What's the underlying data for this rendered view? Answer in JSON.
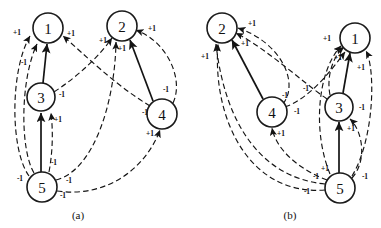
{
  "figure": {
    "width": 381,
    "height": 228,
    "background": "#ffffff",
    "ink_color": "#141414",
    "panels": [
      {
        "id": "panel-a",
        "caption": "(a)",
        "caption_pos": {
          "x": 78,
          "y": 215
        },
        "nodes": [
          {
            "id": "1",
            "label": "1",
            "x": 48,
            "y": 28,
            "r": 15
          },
          {
            "id": "2",
            "label": "2",
            "x": 122,
            "y": 26,
            "r": 15
          },
          {
            "id": "3",
            "label": "3",
            "x": 41,
            "y": 97,
            "r": 14
          },
          {
            "id": "4",
            "label": "4",
            "x": 162,
            "y": 114,
            "r": 15
          },
          {
            "id": "5",
            "label": "5",
            "x": 42,
            "y": 187,
            "r": 15
          }
        ],
        "edges": [
          {
            "from": "3",
            "to": "1",
            "style": "solid",
            "weight": "",
            "path": "M 43 83 L 47 44"
          },
          {
            "from": "4",
            "to": "2",
            "style": "solid",
            "weight": "",
            "path": "M 153 101 L 130 40"
          },
          {
            "from": "5",
            "to": "3",
            "style": "solid",
            "weight": "",
            "path": "M 41 172 L 41 113"
          },
          {
            "from": "5",
            "to": "1",
            "style": "dashed",
            "weight": "-1",
            "path": "M 34 173 C 20 150 20 80 37 44"
          },
          {
            "from": "5",
            "to": "1",
            "style": "dashed",
            "weight": "-1",
            "path": "M 29 176 C 10 150 10 70 30 36"
          },
          {
            "from": "5",
            "to": "3",
            "style": "dashed",
            "weight": "+1",
            "path": "M 49 172 C 53 150 53 130 51 113"
          },
          {
            "from": "5",
            "to": "2",
            "style": "dashed",
            "weight": "-1",
            "path": "M 56 180 C 95 170 115 100 116 42"
          },
          {
            "from": "5",
            "to": "4",
            "style": "dashed",
            "weight": "-1",
            "path": "M 57 191 C 105 198 145 170 160 130"
          },
          {
            "from": "4",
            "to": "1",
            "style": "dashed",
            "weight": "+1",
            "path": "M 150 106 C 115 85 85 55 63 36"
          },
          {
            "from": "4",
            "to": "2",
            "style": "dashed",
            "weight": "+1",
            "path": "M 173 103 C 184 80 168 42 136 30"
          },
          {
            "from": "3",
            "to": "2",
            "style": "dashed",
            "weight": "+1",
            "path": "M 54 92 C 80 75 100 55 112 38"
          }
        ],
        "weight_labels": [
          {
            "text": "+1",
            "x": 17,
            "y": 32
          },
          {
            "text": "-1",
            "x": 24,
            "y": 62
          },
          {
            "text": "+1",
            "x": 71,
            "y": 33
          },
          {
            "text": "+1",
            "x": 103,
            "y": 40
          },
          {
            "text": "+1",
            "x": 122,
            "y": 48
          },
          {
            "text": "+1",
            "x": 152,
            "y": 28
          },
          {
            "text": "-1",
            "x": 62,
            "y": 94
          },
          {
            "text": "-1",
            "x": 166,
            "y": 89
          },
          {
            "text": "-1",
            "x": 145,
            "y": 112
          },
          {
            "text": "+1",
            "x": 58,
            "y": 119
          },
          {
            "text": "+1",
            "x": 150,
            "y": 133
          },
          {
            "text": "-1",
            "x": 54,
            "y": 162
          },
          {
            "text": "-1",
            "x": 20,
            "y": 178
          },
          {
            "text": "-1",
            "x": 69,
            "y": 180
          },
          {
            "text": "-1",
            "x": 63,
            "y": 195
          }
        ]
      },
      {
        "id": "panel-b",
        "caption": "(b)",
        "caption_pos": {
          "x": 290,
          "y": 215
        },
        "nodes": [
          {
            "id": "2",
            "label": "2",
            "x": 222,
            "y": 28,
            "r": 15
          },
          {
            "id": "1",
            "label": "1",
            "x": 355,
            "y": 38,
            "r": 15
          },
          {
            "id": "4",
            "label": "4",
            "x": 272,
            "y": 112,
            "r": 15
          },
          {
            "id": "3",
            "label": "3",
            "x": 339,
            "y": 107,
            "r": 14
          },
          {
            "id": "5",
            "label": "5",
            "x": 340,
            "y": 188,
            "r": 15
          }
        ],
        "edges": [
          {
            "from": "4",
            "to": "2",
            "style": "solid",
            "weight": "",
            "path": "M 263 99 L 232 40"
          },
          {
            "from": "3",
            "to": "1",
            "style": "solid",
            "weight": "",
            "path": "M 343 93 L 350 53"
          },
          {
            "from": "5",
            "to": "3",
            "style": "solid",
            "weight": "",
            "path": "M 339 173 L 339 122"
          },
          {
            "from": "5",
            "to": "2",
            "style": "dashed",
            "weight": "-1",
            "path": "M 325 190 C 250 196 212 120 218 44"
          },
          {
            "from": "5",
            "to": "2",
            "style": "dashed",
            "weight": "-1",
            "path": "M 325 184 C 262 178 225 125 216 44"
          },
          {
            "from": "5",
            "to": "4",
            "style": "dashed",
            "weight": "+1",
            "path": "M 327 180 C 300 170 276 150 272 128"
          },
          {
            "from": "5",
            "to": "3",
            "style": "dashed",
            "weight": "+1",
            "path": "M 352 178 C 368 160 362 130 350 119"
          },
          {
            "from": "5",
            "to": "1",
            "style": "dashed",
            "weight": "+1",
            "path": "M 330 174 C 312 130 318 70 341 46"
          },
          {
            "from": "5",
            "to": "1",
            "style": "dashed",
            "weight": "+1",
            "path": "M 352 176 C 374 140 376 70 366 51"
          },
          {
            "from": "3",
            "to": "1",
            "style": "dashed",
            "weight": "+1",
            "path": "M 330 95 C 326 75 334 55 344 47"
          },
          {
            "from": "3",
            "to": "2",
            "style": "dashed",
            "weight": "-1",
            "path": "M 327 99 C 300 80 268 50 236 33"
          },
          {
            "from": "4",
            "to": "2",
            "style": "dashed",
            "weight": "-1",
            "path": "M 283 104 C 300 82 280 42 238 28"
          },
          {
            "from": "4",
            "to": "1",
            "style": "dashed",
            "weight": "+1",
            "path": "M 285 107 C 310 98 330 72 345 52"
          }
        ],
        "weight_labels": [
          {
            "text": "+1",
            "x": 252,
            "y": 23
          },
          {
            "text": "+1",
            "x": 245,
            "y": 43
          },
          {
            "text": "+1",
            "x": 205,
            "y": 56
          },
          {
            "text": "+1",
            "x": 327,
            "y": 38
          },
          {
            "text": "+1",
            "x": 338,
            "y": 57
          },
          {
            "text": "+1",
            "x": 361,
            "y": 67
          },
          {
            "text": "-1",
            "x": 306,
            "y": 88
          },
          {
            "text": "-1",
            "x": 285,
            "y": 95
          },
          {
            "text": "-1",
            "x": 297,
            "y": 111
          },
          {
            "text": "-1",
            "x": 362,
            "y": 107
          },
          {
            "text": "+1",
            "x": 281,
            "y": 133
          },
          {
            "text": "+1",
            "x": 351,
            "y": 128
          },
          {
            "text": "+1",
            "x": 325,
            "y": 168
          },
          {
            "text": "-1",
            "x": 316,
            "y": 176
          },
          {
            "text": "-1",
            "x": 365,
            "y": 176
          },
          {
            "text": "-1",
            "x": 307,
            "y": 191
          }
        ]
      }
    ]
  }
}
